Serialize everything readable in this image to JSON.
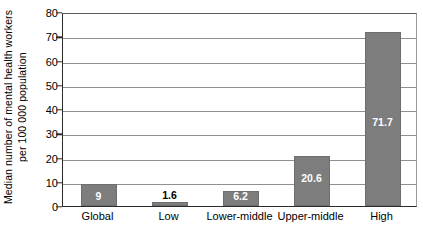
{
  "chart_data": {
    "type": "bar",
    "title": "",
    "subtitle": "",
    "xlabel": "",
    "ylabel": "Median number of mental health workers per 100 000 population",
    "ylabel_line1": "Median number of mental health workers",
    "ylabel_line2": "per 100 000 population",
    "categories": [
      "Global",
      "Low",
      "Lower-middle",
      "Upper-middle",
      "High"
    ],
    "values": [
      9,
      1.6,
      6.2,
      20.6,
      71.7
    ],
    "data_labels": [
      "9",
      "1.6",
      "6.2",
      "20.6",
      "71.7"
    ],
    "data_label_position": [
      "inside",
      "outside",
      "inside",
      "inside",
      "inside"
    ],
    "ylim": [
      0,
      80
    ],
    "yticks": [
      0,
      10,
      20,
      30,
      40,
      50,
      60,
      70,
      80
    ],
    "ytick_labels": [
      "0",
      "10",
      "20",
      "30",
      "40",
      "50",
      "60",
      "70",
      "80"
    ],
    "grid": true,
    "grid_axis": "y",
    "legend": false,
    "legend_position": "none",
    "bar_color": "#7d7d7d",
    "grid_color": "#8f8f8f",
    "axis_color": "#2b2b2b",
    "background_color": "#ffffff",
    "label_color_inside": "#ffffff",
    "label_color_outside": "#000000"
  }
}
